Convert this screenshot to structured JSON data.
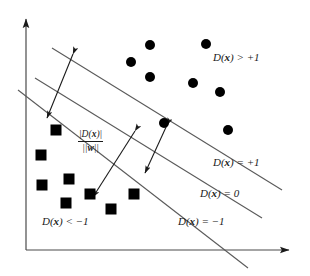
{
  "figure": {
    "type": "svm-margin-diagram",
    "background": "#ffffff",
    "ink_color": "#1a1a1a",
    "line_color": "#555555",
    "width": 310,
    "height": 276
  },
  "axes": {
    "y_axis": {
      "x": 26,
      "y_top": 15,
      "y_bottom": 250,
      "arrow": "up"
    },
    "x_axis": {
      "y": 250,
      "x_left": 26,
      "x_right": 293,
      "arrow": "right"
    }
  },
  "labels": {
    "region_positive": {
      "text": "D(x) > +1",
      "prefix": "D(",
      "var": "x",
      "suffix": ") > +1",
      "x": 213,
      "y": 52
    },
    "line_plus_one": {
      "text": "D(x) = +1",
      "prefix": "D(",
      "var": "x",
      "suffix": ") = +1",
      "x": 213,
      "y": 157
    },
    "line_zero": {
      "text": "D(x) = 0",
      "prefix": "D(",
      "var": "x",
      "suffix": ") = 0",
      "x": 200,
      "y": 188
    },
    "line_minus_one": {
      "text": "D(x) = -1",
      "prefix": "D(",
      "var": "x",
      "suffix": ") = −1",
      "x": 178,
      "y": 216
    },
    "region_negative": {
      "text": "D(x) < -1",
      "prefix": "D(",
      "var": "x",
      "suffix": ") < −1",
      "x": 42,
      "y": 216
    }
  },
  "margin_annotation": {
    "numerator_text": "|D(x)|",
    "numerator_prefix": "|D(",
    "numerator_var": "x",
    "numerator_suffix": ")|",
    "denominator_text": "||w||",
    "denominator_prefix": "||",
    "denominator_var": "w",
    "denominator_suffix": "||",
    "x": 78,
    "y": 129
  },
  "decision_lines": [
    {
      "name": "upper-margin",
      "label": "D(x) = +1",
      "x1": 52,
      "y1": 48,
      "x2": 282,
      "y2": 190
    },
    {
      "name": "decision-boundary",
      "label": "D(x) = 0",
      "x1": 35,
      "y1": 78,
      "x2": 262,
      "y2": 218
    },
    {
      "name": "lower-margin",
      "label": "D(x) = -1",
      "x1": 18,
      "y1": 90,
      "x2": 248,
      "y2": 268
    }
  ],
  "margin_arrows": [
    {
      "name": "margin-width-arrow",
      "x1": 73,
      "y1": 54,
      "x2": 47,
      "y2": 118,
      "heads": "both"
    },
    {
      "name": "support-vector-margin-arrow",
      "x1": 167,
      "y1": 125,
      "x2": 145,
      "y2": 173,
      "heads": "both"
    },
    {
      "name": "distance-callout-arrow",
      "x1": 135,
      "y1": 131,
      "x2": 93,
      "y2": 197,
      "heads": "both"
    }
  ],
  "circles": {
    "class_label": "D(x) > +1",
    "marker": "filled-circle",
    "radius": 5,
    "points": [
      {
        "x": 150,
        "y": 45
      },
      {
        "x": 206,
        "y": 44
      },
      {
        "x": 131,
        "y": 62
      },
      {
        "x": 150,
        "y": 77
      },
      {
        "x": 193,
        "y": 83
      },
      {
        "x": 220,
        "y": 92
      },
      {
        "x": 228,
        "y": 130
      },
      {
        "x": 164,
        "y": 123
      }
    ]
  },
  "squares": {
    "class_label": "D(x) < -1",
    "marker": "filled-square",
    "size": 11,
    "points": [
      {
        "x": 56,
        "y": 130
      },
      {
        "x": 41,
        "y": 155
      },
      {
        "x": 42,
        "y": 185
      },
      {
        "x": 69,
        "y": 179
      },
      {
        "x": 66,
        "y": 203
      },
      {
        "x": 90,
        "y": 194
      },
      {
        "x": 111,
        "y": 209
      },
      {
        "x": 134,
        "y": 194
      }
    ]
  }
}
